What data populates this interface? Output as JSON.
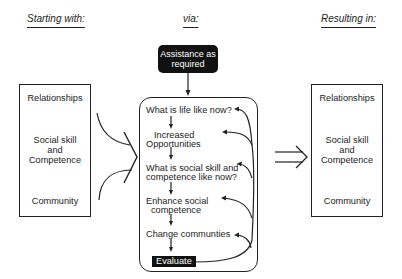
{
  "headers": {
    "starting": "Starting with:",
    "via": "via:",
    "resulting": "Resulting in:"
  },
  "left_box": {
    "items": [
      "Relationships",
      "Social skill",
      "and",
      "Competence",
      "Community"
    ]
  },
  "right_box": {
    "items": [
      "Relationships",
      "Social skill",
      "and",
      "Competence",
      "Community"
    ]
  },
  "assistance": {
    "line1": "Assistance as",
    "line2": "required"
  },
  "process_steps": {
    "s1": "What is life like now?",
    "s2a": "Increased",
    "s2b": "Opportunities",
    "s3a": "What is social skill and",
    "s3b": "competence like now?",
    "s4a": "Enhance social",
    "s4b": "competence",
    "s5": "Change communties",
    "s6": "Evaluate"
  },
  "colors": {
    "line": "#222222",
    "block_fill": "#111111",
    "block_text": "#ffffff"
  }
}
